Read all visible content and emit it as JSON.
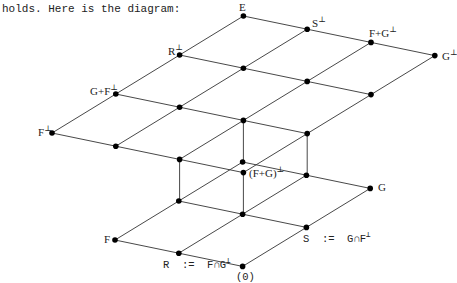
{
  "intro_text": "holds. Here is the diagram:",
  "diagram": {
    "upper_layer_labels": {
      "E": "E",
      "S_perp": "S",
      "F_plus_G_perp": "F+G",
      "G_perp": "G",
      "R_perp": "R",
      "G_plus_F_perp": "G+F",
      "F_perp": "F",
      "F_plus_G_all_perp": "(F+G)"
    },
    "lower_layer_labels": {
      "G": "G",
      "S_def": "S  :=  G∩F",
      "F": "F",
      "R_def": "R  :=  F∩G",
      "zero": "(0)"
    },
    "perp_symbol": "⊥"
  }
}
